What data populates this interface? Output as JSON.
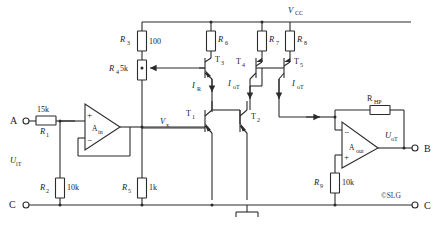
{
  "diagram": {
    "watermark": "©SLG",
    "supply": {
      "label": "V",
      "sub": "CC"
    },
    "terminals": [
      {
        "name": "A",
        "label": "A"
      },
      {
        "name": "B",
        "label": "B"
      },
      {
        "name": "C-left",
        "label": "C"
      },
      {
        "name": "C-right",
        "label": "C"
      }
    ],
    "signals": {
      "input": {
        "label": "U",
        "sub": "iT"
      },
      "output": {
        "label": "U",
        "sub": "oT"
      },
      "node_vx": {
        "label": "V",
        "sub": "x"
      }
    },
    "currents": [
      {
        "name": "i-r",
        "label": "I",
        "sub": "R"
      },
      {
        "name": "i-ot-left",
        "label": "I",
        "sub": "oT"
      },
      {
        "name": "i-ot-right",
        "label": "I",
        "sub": "oT"
      }
    ],
    "resistors": [
      {
        "name": "r1",
        "label": "R",
        "sub": "1",
        "value": "15k"
      },
      {
        "name": "r2",
        "label": "R",
        "sub": "2",
        "value": "10k"
      },
      {
        "name": "r3",
        "label": "R",
        "sub": "3",
        "value": "100"
      },
      {
        "name": "r4",
        "label": "R",
        "sub": "4",
        "value": "5k"
      },
      {
        "name": "r5",
        "label": "R",
        "sub": "5",
        "value": "1k"
      },
      {
        "name": "r6",
        "label": "R",
        "sub": "6",
        "value": ""
      },
      {
        "name": "r7",
        "label": "R",
        "sub": "7",
        "value": ""
      },
      {
        "name": "r8",
        "label": "R",
        "sub": "8",
        "value": ""
      },
      {
        "name": "r9",
        "label": "R",
        "sub": "9",
        "value": "10k"
      },
      {
        "name": "rhp",
        "label": "R",
        "sub": "HP",
        "value": ""
      }
    ],
    "transistors": [
      {
        "name": "t1",
        "label": "T",
        "sub": "1",
        "type": "npn"
      },
      {
        "name": "t2",
        "label": "T",
        "sub": "2",
        "type": "npn"
      },
      {
        "name": "t3",
        "label": "T",
        "sub": "3",
        "type": "npn"
      },
      {
        "name": "t4",
        "label": "T",
        "sub": "4",
        "type": "pnp"
      },
      {
        "name": "t5",
        "label": "T",
        "sub": "5",
        "type": "pnp"
      }
    ],
    "opamps": [
      {
        "name": "a-in",
        "label": "A",
        "sub": "in",
        "plus": "+",
        "minus": "−"
      },
      {
        "name": "a-out",
        "label": "A",
        "sub": "out",
        "plus": "+",
        "minus": "−"
      }
    ],
    "ground": {
      "name": "ground-symbol"
    },
    "colors": {
      "line": "#2b2b2b",
      "background": "#ffffff"
    }
  }
}
